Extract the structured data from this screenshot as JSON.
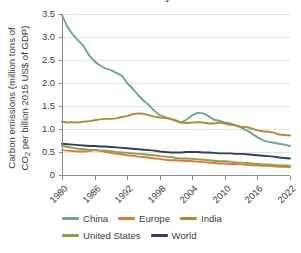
{
  "chart_data": {
    "type": "line",
    "title": "Carbon intensity of GDP",
    "xlabel": "",
    "ylabel": "Carbon emissions (million tons of CO2 per billion 2015 US$ of GDP)",
    "ylabel_line1": "Carbon emissions (million tons of",
    "ylabel_line2_pre": "CO",
    "ylabel_line2_sub": "2",
    "ylabel_line2_post": " per billion 2015 US$ of GDP)",
    "xlim": [
      1980,
      2022
    ],
    "ylim": [
      0,
      3.5
    ],
    "grid": "horizontal",
    "legend_position": "bottom",
    "y_ticks": [
      "0",
      "0.5",
      "1.0",
      "1.5",
      "2.0",
      "2.5",
      "3.0",
      "3.5"
    ],
    "y_tick_values": [
      0,
      0.5,
      1.0,
      1.5,
      2.0,
      2.5,
      3.0,
      3.5
    ],
    "x_ticks": [
      "1980",
      "1986",
      "1992",
      "1998",
      "2004",
      "2010",
      "2016",
      "2022"
    ],
    "x_tick_values": [
      1980,
      1986,
      1992,
      1998,
      2004,
      2010,
      2016,
      2022
    ],
    "x": [
      1980,
      1981,
      1982,
      1983,
      1984,
      1985,
      1986,
      1987,
      1988,
      1989,
      1990,
      1991,
      1992,
      1993,
      1994,
      1995,
      1996,
      1997,
      1998,
      1999,
      2000,
      2001,
      2002,
      2003,
      2004,
      2005,
      2006,
      2007,
      2008,
      2009,
      2010,
      2011,
      2012,
      2013,
      2014,
      2015,
      2016,
      2017,
      2018,
      2019,
      2020,
      2021,
      2022
    ],
    "series": [
      {
        "name": "China",
        "color": "#6aa894",
        "values": [
          3.47,
          3.22,
          3.05,
          2.92,
          2.8,
          2.6,
          2.47,
          2.38,
          2.32,
          2.28,
          2.22,
          2.16,
          2.0,
          1.88,
          1.74,
          1.62,
          1.52,
          1.4,
          1.3,
          1.26,
          1.22,
          1.17,
          1.14,
          1.21,
          1.3,
          1.35,
          1.34,
          1.28,
          1.2,
          1.18,
          1.14,
          1.12,
          1.08,
          1.03,
          0.97,
          0.9,
          0.82,
          0.76,
          0.72,
          0.7,
          0.68,
          0.66,
          0.63
        ]
      },
      {
        "name": "Europe",
        "color": "#e8743b",
        "values": [
          0.54,
          0.53,
          0.52,
          0.51,
          0.51,
          0.52,
          0.54,
          0.53,
          0.5,
          0.48,
          0.46,
          0.45,
          0.43,
          0.42,
          0.4,
          0.39,
          0.38,
          0.36,
          0.35,
          0.33,
          0.32,
          0.32,
          0.31,
          0.31,
          0.3,
          0.29,
          0.28,
          0.27,
          0.26,
          0.25,
          0.25,
          0.24,
          0.24,
          0.23,
          0.22,
          0.21,
          0.21,
          0.2,
          0.2,
          0.19,
          0.18,
          0.18,
          0.17
        ]
      },
      {
        "name": "India",
        "color": "#b18c2e",
        "values": [
          1.16,
          1.14,
          1.15,
          1.14,
          1.16,
          1.17,
          1.19,
          1.21,
          1.22,
          1.22,
          1.23,
          1.26,
          1.28,
          1.32,
          1.34,
          1.33,
          1.3,
          1.27,
          1.25,
          1.24,
          1.22,
          1.19,
          1.14,
          1.13,
          1.14,
          1.15,
          1.14,
          1.12,
          1.12,
          1.14,
          1.12,
          1.09,
          1.08,
          1.05,
          1.04,
          1.01,
          0.97,
          0.95,
          0.94,
          0.92,
          0.88,
          0.87,
          0.86
        ]
      },
      {
        "name": "United States",
        "color": "#88a24a",
        "values": [
          0.63,
          0.61,
          0.59,
          0.57,
          0.56,
          0.55,
          0.54,
          0.53,
          0.53,
          0.52,
          0.5,
          0.49,
          0.48,
          0.47,
          0.46,
          0.45,
          0.44,
          0.43,
          0.41,
          0.4,
          0.39,
          0.37,
          0.36,
          0.36,
          0.35,
          0.34,
          0.33,
          0.32,
          0.31,
          0.3,
          0.3,
          0.29,
          0.27,
          0.27,
          0.26,
          0.25,
          0.24,
          0.23,
          0.23,
          0.22,
          0.21,
          0.21,
          0.2
        ]
      },
      {
        "name": "World",
        "color": "#2e3f63",
        "values": [
          0.68,
          0.67,
          0.66,
          0.65,
          0.64,
          0.63,
          0.63,
          0.62,
          0.62,
          0.61,
          0.6,
          0.59,
          0.58,
          0.57,
          0.56,
          0.55,
          0.54,
          0.53,
          0.51,
          0.5,
          0.49,
          0.49,
          0.49,
          0.5,
          0.5,
          0.5,
          0.49,
          0.49,
          0.48,
          0.47,
          0.47,
          0.47,
          0.46,
          0.46,
          0.45,
          0.44,
          0.43,
          0.42,
          0.41,
          0.4,
          0.38,
          0.37,
          0.36
        ]
      }
    ]
  },
  "legend": {
    "row1": [
      "China",
      "Europe",
      "India"
    ],
    "row2": [
      "United States",
      "World"
    ]
  },
  "colors": {
    "china": "#6aa894",
    "europe": "#e8743b",
    "india": "#b18c2e",
    "united_states": "#88a24a",
    "world": "#2e3f63",
    "grid": "#e4e4e4",
    "axis": "#8c8c8c",
    "text": "#3d3d3d"
  }
}
